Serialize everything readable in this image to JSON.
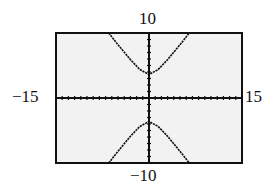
{
  "chart_data": {
    "type": "line",
    "title": "",
    "xlabel": "",
    "ylabel": "",
    "xlim": [
      -15,
      15
    ],
    "ylim": [
      -10,
      10
    ],
    "tick_labels": {
      "xmin": "−15",
      "xmax": "15",
      "ymin": "−10",
      "ymax": "10"
    },
    "grid": false,
    "axis_ticks": true,
    "legend": null,
    "series": [
      {
        "name": "upper branch",
        "x": [
          -6.5,
          -5,
          -3,
          -1.5,
          0,
          1.5,
          3,
          5,
          6.5
        ],
        "y": [
          10,
          8.2,
          5.9,
          4.4,
          3.6,
          4.4,
          5.9,
          8.2,
          10
        ]
      },
      {
        "name": "lower branch",
        "x": [
          -6.5,
          -5,
          -3,
          -1.5,
          0,
          1.5,
          3,
          5,
          6.5
        ],
        "y": [
          -10,
          -8.2,
          -5.9,
          -4.4,
          -3.6,
          -4.4,
          -5.9,
          -8.2,
          -10
        ]
      }
    ]
  },
  "colors": {
    "background": "#ffffff",
    "plot_bg": "#f2f2f2",
    "ink": "#111111"
  }
}
